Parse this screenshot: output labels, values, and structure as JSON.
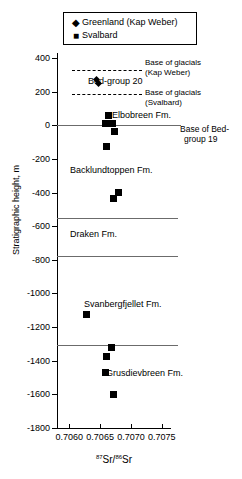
{
  "chart_data": {
    "type": "scatter",
    "title": "",
    "xlabel": "87Sr/86Sr",
    "xlabel_sup1": "87",
    "xlabel_mid": "Sr/",
    "xlabel_sup2": "86",
    "xlabel_end": "Sr",
    "ylabel": "Stratigraphic height, m",
    "xlim": [
      0.7058,
      0.70765
    ],
    "ylim": [
      -1800,
      430
    ],
    "xticks": [
      "0.7060",
      "0.7065",
      "0.7070",
      "0.7075"
    ],
    "xtick_values": [
      0.706,
      0.7065,
      0.707,
      0.7075
    ],
    "yticks": [
      "400",
      "200",
      "0",
      "-200",
      "-400",
      "-600",
      "-800",
      "-1000",
      "-1200",
      "-1400",
      "-1600",
      "-1800"
    ],
    "ytick_values": [
      400,
      200,
      0,
      -200,
      -400,
      -600,
      -800,
      -1000,
      -1200,
      -1400,
      -1600,
      -1800
    ],
    "grid": false,
    "legend_position": "top",
    "series": [
      {
        "name": "Greenland (Kap Weber)",
        "marker": "diamond",
        "points": [
          {
            "x": 0.70644,
            "y": 275
          },
          {
            "x": 0.70648,
            "y": 250
          }
        ]
      },
      {
        "name": "Svalbard",
        "marker": "square",
        "points": [
          {
            "x": 0.70663,
            "y": 60
          },
          {
            "x": 0.70659,
            "y": 10
          },
          {
            "x": 0.7067,
            "y": 8
          },
          {
            "x": 0.70673,
            "y": -35
          },
          {
            "x": 0.70661,
            "y": -128
          },
          {
            "x": 0.70672,
            "y": -435
          },
          {
            "x": 0.7068,
            "y": -398
          },
          {
            "x": 0.70628,
            "y": -1125
          },
          {
            "x": 0.70669,
            "y": -1320
          },
          {
            "x": 0.70661,
            "y": -1375
          },
          {
            "x": 0.70659,
            "y": -1468
          },
          {
            "x": 0.70672,
            "y": -1598
          }
        ]
      }
    ],
    "boundary_lines": [
      {
        "label": "Base of Bed-group 19",
        "y": 0,
        "style": "solid"
      },
      {
        "label": "",
        "y": -550,
        "style": "solid"
      },
      {
        "label": "",
        "y": -780,
        "style": "solid"
      },
      {
        "label": "",
        "y": -1305,
        "style": "solid"
      }
    ],
    "glacial_lines": [
      {
        "label": "Base of glacials (Kap Weber)",
        "y": 330,
        "style": "dashed"
      },
      {
        "label": "Base of glacials (Svalbard)",
        "y": 185,
        "style": "dashed"
      }
    ],
    "unit_labels": [
      {
        "text": "Bed-group 20",
        "y": 262
      },
      {
        "text": "Elbobreen Fm.",
        "y": 62
      },
      {
        "text": "Backlundtoppen Fm.",
        "y": -265
      },
      {
        "text": "Draken Fm.",
        "y": -645
      },
      {
        "text": "Svanbergfjellet Fm.",
        "y": -1065
      },
      {
        "text": "Grusdievbreen Fm.",
        "y": -1470
      }
    ],
    "annotations": [
      {
        "line1": "Base of glacials",
        "line2": "(Kap Weber)"
      },
      {
        "line1": "Base of glacials",
        "line2": "(Svalbard)"
      },
      {
        "line1": "Base of Bed-",
        "line2": "group 19"
      }
    ]
  },
  "legend": {
    "entries": [
      {
        "label": "Greenland (Kap Weber)",
        "symbol": "◆",
        "icon": "diamond-marker-icon"
      },
      {
        "label": "Svalbard",
        "symbol": "■",
        "icon": "square-marker-icon"
      }
    ]
  },
  "labels": {
    "bed_group_20": "Bed-group 20",
    "elbobreen": "Elbobreen Fm.",
    "backlundtoppen": "Backlundtoppen Fm.",
    "draken": "Draken Fm.",
    "svanbergfjellet": "Svanbergfjellet Fm.",
    "grusdievbreen": "Grusdievbreen Fm.",
    "base_glacials_kw_1": "Base of glacials",
    "base_glacials_kw_2": "(Kap Weber)",
    "base_glacials_sv_1": "Base of glacials",
    "base_glacials_sv_2": "(Svalbard)",
    "base_bedgroup19_1": "Base of Bed-",
    "base_bedgroup19_2": "group 19"
  },
  "axes": {
    "y_title": "Stratigraphic height, m",
    "x_sup1": "87",
    "x_mid": "Sr/",
    "x_sup2": "86",
    "x_end": "Sr",
    "yticks": [
      "400",
      "200",
      "0",
      "-200",
      "-400",
      "-600",
      "-800",
      "-1000",
      "-1200",
      "-1400",
      "-1600",
      "-1800"
    ],
    "xticks": [
      "0.7060",
      "0.7065",
      "0.7070",
      "0.7075"
    ]
  },
  "colors": {
    "marker": "#000000",
    "axis": "#000000",
    "boundary_line": "#6b6b6b",
    "background": "#ffffff"
  }
}
